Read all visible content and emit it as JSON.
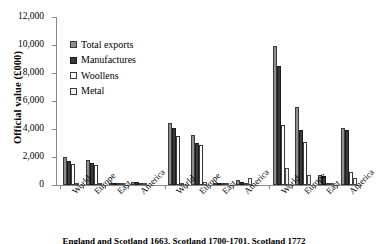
{
  "chart_data": {
    "type": "bar",
    "title": "",
    "xlabel": "",
    "ylabel": "Official value (£000)",
    "ylim": [
      0,
      12000
    ],
    "ytick_labels": [
      "0",
      "2,000",
      "4,000",
      "6,000",
      "8,000",
      "10,000",
      "12,000"
    ],
    "ytick_values": [
      0,
      2000,
      4000,
      6000,
      8000,
      10000,
      12000
    ],
    "grid": false,
    "legend_position": "upper-left-inside",
    "categories": [
      "World",
      "Europe",
      "East",
      "America",
      "World",
      "Europe",
      "East",
      "America",
      "World",
      "Europe",
      "East",
      "America"
    ],
    "panels": [
      "England 1663",
      "Scotland 1663",
      "England 1700-1701",
      "Scotland 1700-1701",
      "England 1772",
      "Scotland 1772"
    ],
    "series": [
      {
        "name": "Total exports",
        "color": "#8f8f8f",
        "values": [
          2000,
          1800,
          60,
          230,
          4400,
          3600,
          70,
          330,
          9900,
          5600,
          700,
          4100
        ]
      },
      {
        "name": "Manufactures",
        "color": "#3b3b3b",
        "values": [
          1700,
          1600,
          50,
          200,
          4050,
          3000,
          60,
          250,
          8500,
          3900,
          650,
          3950
        ]
      },
      {
        "name": "Woollens",
        "color": "#ffffff",
        "values": [
          1500,
          1400,
          30,
          100,
          3500,
          2850,
          40,
          60,
          4300,
          3050,
          120,
          900
        ]
      },
      {
        "name": "Metal",
        "color": "#f2f2f2",
        "values": [
          70,
          40,
          15,
          60,
          120,
          200,
          20,
          480,
          1200,
          700,
          120,
          500
        ]
      }
    ]
  },
  "legend": {
    "items": [
      {
        "label": "Total exports"
      },
      {
        "label": "Manufactures"
      },
      {
        "label": "Woollens"
      },
      {
        "label": "Metal"
      }
    ]
  },
  "caption": {
    "text": "England and Scotland 1663, Scotland 1700-1701, Scotland 1772"
  }
}
